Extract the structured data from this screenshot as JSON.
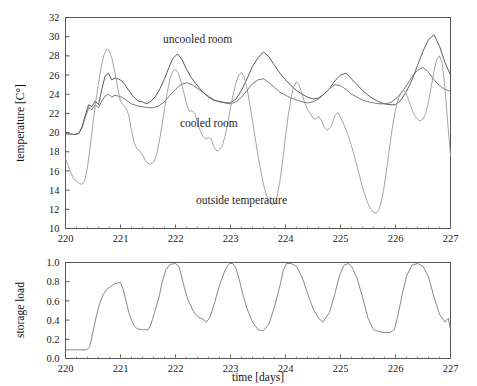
{
  "figure": {
    "background": "#ffffff",
    "panels": [
      "temperature-panel",
      "storage-load-panel"
    ]
  },
  "annotations": {
    "uncooled_room": "uncooled room",
    "cooled_room": "cooled room",
    "outside_temperature": "outside temperature"
  },
  "axis_titles": {
    "temperature_y": "temperature [C°]",
    "storage_y": "storage load",
    "x": "time [days]"
  },
  "ticks": {
    "temperature_y": [
      "10",
      "12",
      "14",
      "16",
      "18",
      "20",
      "22",
      "24",
      "26",
      "28",
      "30",
      "32"
    ],
    "storage_y": [
      "0.0",
      "0.2",
      "0.4",
      "0.6",
      "0.8",
      "1.0"
    ],
    "x": [
      "220",
      "221",
      "222",
      "223",
      "224",
      "225",
      "226",
      "227"
    ]
  },
  "colors": {
    "uncooled_room": "#4a4a4a",
    "cooled_room": "#6b6b6b",
    "outside_temperature": "#9a9a9a",
    "storage_load": "#7a7a7a",
    "axis": "#555555",
    "text": "#1d1d1d"
  },
  "chart_data": [
    {
      "type": "line",
      "title": "",
      "xlabel": "",
      "ylabel": "temperature [C°]",
      "xlim": [
        220,
        227
      ],
      "ylim": [
        10,
        32
      ],
      "xticks": [
        220,
        221,
        222,
        223,
        224,
        225,
        226,
        227
      ],
      "yticks": [
        10,
        12,
        14,
        16,
        18,
        20,
        22,
        24,
        26,
        28,
        30,
        32
      ],
      "grid": false,
      "legend": "inline-annotations",
      "series": [
        {
          "name": "uncooled room",
          "color": "#4a4a4a",
          "x": [
            220.0,
            220.08,
            220.16,
            220.24,
            220.3,
            220.36,
            220.42,
            220.48,
            220.54,
            220.6,
            220.66,
            220.72,
            220.78,
            220.84,
            220.9,
            220.96,
            221.02,
            221.08,
            221.16,
            221.24,
            221.32,
            221.4,
            221.48,
            221.56,
            221.64,
            221.72,
            221.8,
            221.88,
            221.96,
            222.04,
            222.12,
            222.2,
            222.28,
            222.36,
            222.44,
            222.52,
            222.6,
            222.68,
            222.76,
            222.84,
            222.92,
            223.0,
            223.1,
            223.2,
            223.3,
            223.4,
            223.5,
            223.6,
            223.7,
            223.8,
            223.9,
            224.0,
            224.1,
            224.2,
            224.3,
            224.4,
            224.5,
            224.6,
            224.7,
            224.8,
            224.9,
            225.0,
            225.1,
            225.2,
            225.3,
            225.4,
            225.5,
            225.6,
            225.7,
            225.8,
            225.9,
            226.0,
            226.1,
            226.2,
            226.3,
            226.4,
            226.5,
            226.6,
            226.7,
            226.8,
            226.9,
            227.0
          ],
          "y": [
            19.9,
            19.85,
            19.8,
            19.9,
            20.6,
            21.8,
            22.9,
            22.7,
            23.3,
            22.9,
            24.5,
            25.9,
            26.2,
            25.5,
            25.7,
            25.6,
            25.4,
            25.0,
            24.3,
            23.7,
            23.3,
            23.2,
            23.0,
            23.3,
            23.8,
            24.6,
            25.6,
            26.8,
            27.8,
            28.2,
            27.6,
            26.6,
            25.8,
            25.2,
            24.6,
            24.1,
            23.7,
            23.4,
            23.3,
            23.2,
            23.1,
            23.1,
            23.5,
            24.4,
            25.6,
            26.9,
            27.8,
            28.4,
            27.9,
            27.0,
            26.2,
            25.5,
            24.9,
            24.4,
            24.0,
            23.7,
            23.5,
            23.6,
            24.0,
            24.6,
            25.4,
            26.0,
            26.2,
            25.6,
            25.0,
            24.4,
            23.9,
            23.5,
            23.2,
            23.0,
            22.9,
            22.9,
            23.4,
            24.3,
            25.5,
            27.0,
            28.5,
            29.7,
            30.2,
            29.0,
            27.3,
            26.0,
            25.1,
            24.6
          ],
          "note": "upper dark curve; daily peaks rising from ~26 to ~30 by day 226.7"
        },
        {
          "name": "cooled room",
          "color": "#6b6b6b",
          "x": [
            220.0,
            220.08,
            220.16,
            220.24,
            220.3,
            220.36,
            220.42,
            220.48,
            220.54,
            220.6,
            220.66,
            220.72,
            220.78,
            220.84,
            220.9,
            220.96,
            221.02,
            221.1,
            221.2,
            221.3,
            221.4,
            221.5,
            221.6,
            221.7,
            221.8,
            221.9,
            222.0,
            222.1,
            222.2,
            222.3,
            222.4,
            222.5,
            222.6,
            222.7,
            222.8,
            222.9,
            223.0,
            223.1,
            223.2,
            223.3,
            223.4,
            223.5,
            223.6,
            223.7,
            223.8,
            223.9,
            224.0,
            224.1,
            224.2,
            224.3,
            224.4,
            224.5,
            224.6,
            224.7,
            224.8,
            224.9,
            225.0,
            225.1,
            225.2,
            225.3,
            225.4,
            225.5,
            225.6,
            225.7,
            225.8,
            225.9,
            226.0,
            226.1,
            226.2,
            226.3,
            226.4,
            226.5,
            226.6,
            226.7,
            226.8,
            226.9,
            227.0
          ],
          "y": [
            19.9,
            19.85,
            19.8,
            19.9,
            20.5,
            21.6,
            22.6,
            22.4,
            22.9,
            22.6,
            23.3,
            23.8,
            24.0,
            23.7,
            23.9,
            23.8,
            23.7,
            23.4,
            23.0,
            22.8,
            22.7,
            22.6,
            22.6,
            22.8,
            23.2,
            23.9,
            24.5,
            25.0,
            25.2,
            25.0,
            24.6,
            24.2,
            23.8,
            23.4,
            23.2,
            23.1,
            23.0,
            23.2,
            23.7,
            24.4,
            25.1,
            25.5,
            25.6,
            25.2,
            24.7,
            24.2,
            23.9,
            23.6,
            23.4,
            23.2,
            23.1,
            23.2,
            23.5,
            24.0,
            24.6,
            25.0,
            24.9,
            24.5,
            24.0,
            23.7,
            23.4,
            23.2,
            23.1,
            23.0,
            23.0,
            23.1,
            23.5,
            24.1,
            24.9,
            25.8,
            26.5,
            26.8,
            26.3,
            25.5,
            24.9,
            24.5,
            24.3
          ],
          "note": "middle curve, lower amplitude, tracks below uncooled room"
        },
        {
          "name": "outside temperature",
          "color": "#9a9a9a",
          "x": [
            220.0,
            220.05,
            220.1,
            220.15,
            220.2,
            220.25,
            220.3,
            220.35,
            220.4,
            220.45,
            220.5,
            220.55,
            220.6,
            220.65,
            220.7,
            220.75,
            220.8,
            220.85,
            220.9,
            220.95,
            221.0,
            221.05,
            221.1,
            221.15,
            221.2,
            221.25,
            221.3,
            221.35,
            221.4,
            221.45,
            221.5,
            221.55,
            221.6,
            221.65,
            221.7,
            221.75,
            221.8,
            221.85,
            221.9,
            221.95,
            222.0,
            222.05,
            222.1,
            222.15,
            222.2,
            222.25,
            222.3,
            222.35,
            222.4,
            222.45,
            222.5,
            222.55,
            222.6,
            222.65,
            222.7,
            222.75,
            222.8,
            222.85,
            222.9,
            222.95,
            223.0,
            223.05,
            223.1,
            223.15,
            223.2,
            223.25,
            223.3,
            223.35,
            223.4,
            223.45,
            223.5,
            223.55,
            223.6,
            223.65,
            223.7,
            223.75,
            223.8,
            223.85,
            223.9,
            223.95,
            224.0,
            224.05,
            224.1,
            224.15,
            224.2,
            224.25,
            224.3,
            224.35,
            224.4,
            224.45,
            224.5,
            224.55,
            224.6,
            224.65,
            224.7,
            224.75,
            224.8,
            224.85,
            224.9,
            224.95,
            225.0,
            225.05,
            225.1,
            225.15,
            225.2,
            225.25,
            225.3,
            225.35,
            225.4,
            225.45,
            225.5,
            225.55,
            225.6,
            225.65,
            225.7,
            225.75,
            225.8,
            225.85,
            225.9,
            225.95,
            226.0,
            226.05,
            226.1,
            226.15,
            226.2,
            226.25,
            226.3,
            226.35,
            226.4,
            226.45,
            226.5,
            226.55,
            226.6,
            226.65,
            226.7,
            226.75,
            226.8,
            226.85,
            226.9,
            226.95,
            227.0
          ],
          "y": [
            17.3,
            16.5,
            15.8,
            15.2,
            14.9,
            14.7,
            14.6,
            15.0,
            16.4,
            18.6,
            21.0,
            23.2,
            25.2,
            26.9,
            28.1,
            28.7,
            28.5,
            27.6,
            26.2,
            24.6,
            23.2,
            22.9,
            22.6,
            21.8,
            20.2,
            18.9,
            18.3,
            18.1,
            17.7,
            17.1,
            16.8,
            16.7,
            16.9,
            17.6,
            18.9,
            20.6,
            22.5,
            24.2,
            25.6,
            26.4,
            26.6,
            26.2,
            25.3,
            24.2,
            23.0,
            22.2,
            22.3,
            22.0,
            21.0,
            20.2,
            19.6,
            19.3,
            19.5,
            19.3,
            18.5,
            18.1,
            18.2,
            18.6,
            19.6,
            21.0,
            22.6,
            24.0,
            25.2,
            26.0,
            26.3,
            25.8,
            24.6,
            23.0,
            21.2,
            19.4,
            17.6,
            16.0,
            14.6,
            13.5,
            12.8,
            12.5,
            12.6,
            13.4,
            15.0,
            17.2,
            19.6,
            21.8,
            23.6,
            24.8,
            25.3,
            24.9,
            24.0,
            23.1,
            22.4,
            22.0,
            21.5,
            21.4,
            21.7,
            21.3,
            20.6,
            20.3,
            20.4,
            20.9,
            21.8,
            22.1,
            21.6,
            21.0,
            20.3,
            19.5,
            18.6,
            17.6,
            16.5,
            15.4,
            14.3,
            13.4,
            12.6,
            12.0,
            11.7,
            11.6,
            12.0,
            13.0,
            14.6,
            16.6,
            18.8,
            20.8,
            22.4,
            23.5,
            24.2,
            24.4,
            24.0,
            23.2,
            22.4,
            21.8,
            21.4,
            21.2,
            21.4,
            22.0,
            23.2,
            24.8,
            26.4,
            27.6,
            28.0,
            27.2,
            24.6,
            21.0,
            17.6,
            14.8
          ],
          "note": "lowest, most variable curve; deep minima near 11.6 at day 225.6"
        }
      ]
    },
    {
      "type": "line",
      "title": "",
      "xlabel": "time [days]",
      "ylabel": "storage load",
      "xlim": [
        220,
        227
      ],
      "ylim": [
        0.0,
        1.0
      ],
      "xticks": [
        220,
        221,
        222,
        223,
        224,
        225,
        226,
        227
      ],
      "yticks": [
        0.0,
        0.2,
        0.4,
        0.6,
        0.8,
        1.0
      ],
      "grid": false,
      "series": [
        {
          "name": "storage load",
          "color": "#7a7a7a",
          "x": [
            220.0,
            220.1,
            220.2,
            220.3,
            220.38,
            220.44,
            220.5,
            220.56,
            220.62,
            220.68,
            220.75,
            220.82,
            220.9,
            220.97,
            221.0,
            221.05,
            221.1,
            221.15,
            221.2,
            221.25,
            221.3,
            221.4,
            221.5,
            221.55,
            221.62,
            221.7,
            221.76,
            221.82,
            221.9,
            222.0,
            222.06,
            222.1,
            222.16,
            222.22,
            222.3,
            222.36,
            222.42,
            222.5,
            222.56,
            222.62,
            222.7,
            222.8,
            222.9,
            222.98,
            223.04,
            223.1,
            223.16,
            223.22,
            223.3,
            223.4,
            223.5,
            223.6,
            223.7,
            223.8,
            223.9,
            223.96,
            224.02,
            224.1,
            224.2,
            224.3,
            224.4,
            224.5,
            224.6,
            224.68,
            224.8,
            224.9,
            224.98,
            225.06,
            225.14,
            225.2,
            225.3,
            225.4,
            225.5,
            225.6,
            225.7,
            225.8,
            225.9,
            225.98,
            226.04,
            226.12,
            226.2,
            226.3,
            226.4,
            226.5,
            226.6,
            226.7,
            226.8,
            226.9,
            226.96,
            227.0
          ],
          "y": [
            0.09,
            0.09,
            0.09,
            0.09,
            0.09,
            0.12,
            0.28,
            0.44,
            0.57,
            0.66,
            0.72,
            0.75,
            0.78,
            0.79,
            0.79,
            0.72,
            0.6,
            0.48,
            0.4,
            0.34,
            0.31,
            0.3,
            0.3,
            0.35,
            0.48,
            0.64,
            0.8,
            0.92,
            0.98,
            0.99,
            0.96,
            0.88,
            0.74,
            0.62,
            0.52,
            0.46,
            0.43,
            0.41,
            0.38,
            0.42,
            0.56,
            0.76,
            0.92,
            0.99,
            0.99,
            0.94,
            0.82,
            0.68,
            0.52,
            0.38,
            0.3,
            0.29,
            0.36,
            0.54,
            0.76,
            0.92,
            0.99,
            0.99,
            0.96,
            0.85,
            0.68,
            0.52,
            0.42,
            0.38,
            0.48,
            0.68,
            0.86,
            0.97,
            0.99,
            0.96,
            0.84,
            0.64,
            0.42,
            0.3,
            0.28,
            0.27,
            0.27,
            0.3,
            0.44,
            0.66,
            0.86,
            0.97,
            0.99,
            0.96,
            0.85,
            0.64,
            0.46,
            0.38,
            0.42,
            0.3
          ],
          "note": "sawtooth charge/discharge cycles reaching saturation near 1.0 each day"
        }
      ]
    }
  ]
}
